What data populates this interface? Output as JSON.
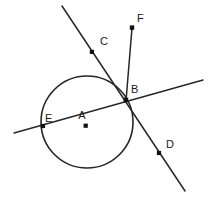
{
  "figure": {
    "type": "geometry-diagram",
    "width": 211,
    "height": 203,
    "background_color": "#ffffff",
    "stroke_color": "#262626",
    "label_color": "#1a1a1a"
  },
  "circle": {
    "label": "circle-A",
    "center_x": 87,
    "center_y": 122,
    "radius": 46,
    "stroke_width": 1.6
  },
  "points": [
    {
      "id": "A",
      "label": "A",
      "x": 86,
      "y": 126,
      "label_x": 85,
      "label_y": 119,
      "dot": true,
      "role": "center"
    },
    {
      "id": "B",
      "label": "B",
      "x": 126,
      "y": 100,
      "label_x": 131,
      "label_y": 93,
      "dot": true,
      "role": "intersection"
    },
    {
      "id": "C",
      "label": "C",
      "x": 92,
      "y": 52,
      "label_x": 100,
      "label_y": 45,
      "dot": true,
      "role": "on-line"
    },
    {
      "id": "D",
      "label": "D",
      "x": 159,
      "y": 153,
      "label_x": 166,
      "label_y": 147,
      "dot": true,
      "role": "on-line"
    },
    {
      "id": "E",
      "label": "E",
      "x": 43,
      "y": 126,
      "label_x": 46,
      "label_y": 121,
      "dot": true,
      "role": "on-circle"
    },
    {
      "id": "F",
      "label": "F",
      "x": 132,
      "y": 28,
      "label_x": 139,
      "label_y": 21,
      "dot": true,
      "role": "ray-endpoint"
    }
  ],
  "lines": [
    {
      "id": "line-CBD",
      "name": "line-c-b-d",
      "x1": 62,
      "y1": 6,
      "x2": 185,
      "y2": 191,
      "stroke_width": 1.5
    },
    {
      "id": "line-EB",
      "name": "secant-e-b",
      "x1": 14,
      "y1": 133,
      "x2": 203,
      "y2": 80,
      "stroke_width": 1.3
    },
    {
      "id": "ray-BF",
      "name": "ray-b-f",
      "x1": 126,
      "y1": 101,
      "x2": 132,
      "y2": 28,
      "stroke_width": 1.5
    }
  ]
}
